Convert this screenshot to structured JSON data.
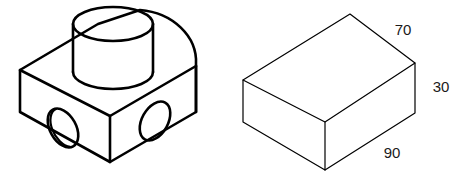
{
  "drawing": {
    "title": "Isometric technical drawing - pictorial views",
    "background_color": "#ffffff",
    "line_color": "#000000",
    "text_color": "#1a1a1a"
  },
  "figures": [
    {
      "id": "left-part",
      "name": "bracket-with-cylindrical-boss",
      "description": "Isometric block with rounded end, cylindrical boss on top face, and two through holes",
      "line_weight": 2.6,
      "features": [
        "rectangular-block",
        "rounded-semicircular-end",
        "cylindrical-boss",
        "left-face-hole",
        "front-face-hole"
      ]
    },
    {
      "id": "right-part",
      "name": "rectangular-block",
      "description": "Isometric rectangular box with dimension annotations",
      "line_weight": 1.2,
      "features": [
        "rectangular-block"
      ]
    }
  ],
  "dimensions": {
    "depth": {
      "value": "70",
      "edge": "top-right-edge",
      "x": 403,
      "y": 31
    },
    "height": {
      "value": "30",
      "edge": "right-vertical-edge",
      "x": 441,
      "y": 88
    },
    "width": {
      "value": "90",
      "edge": "bottom-front-edge",
      "x": 392,
      "y": 154
    }
  }
}
